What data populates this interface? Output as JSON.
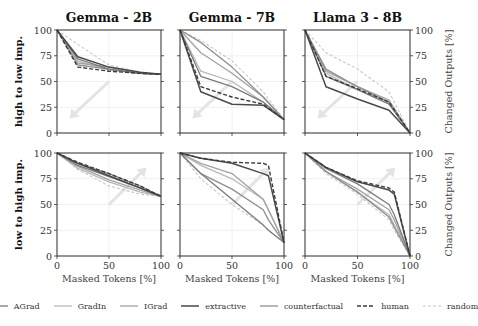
{
  "chart_data": {
    "type": "line",
    "layout": "2x3 grid of line plots",
    "columns": [
      "Gemma - 2B",
      "Gemma - 7B",
      "Llama 3 - 8B"
    ],
    "rows": [
      "high to low imp.",
      "low to high imp."
    ],
    "xlabel": "Masked Tokens [%]",
    "ylabel_right": "Changed Outputs [%]",
    "xlim": [
      0,
      100
    ],
    "ylim": [
      0,
      100
    ],
    "xticks": [
      0,
      50,
      100
    ],
    "yticks": [
      0,
      25,
      50,
      75,
      100
    ],
    "grid": true,
    "legend_position": "bottom",
    "legend": [
      "AGrad",
      "GradIn",
      "IGrad",
      "extractive",
      "counterfactual",
      "human",
      "random"
    ],
    "series_styles": {
      "AGrad": {
        "color": "#7a7a7a",
        "dash": "",
        "width": 1.3
      },
      "GradIn": {
        "color": "#b8b8b8",
        "dash": "",
        "width": 1.3
      },
      "IGrad": {
        "color": "#a2a2a2",
        "dash": "",
        "width": 1.3
      },
      "extractive": {
        "color": "#4a4a4a",
        "dash": "",
        "width": 1.5
      },
      "counterfactual": {
        "color": "#8e8e8e",
        "dash": "",
        "width": 1.3
      },
      "human": {
        "color": "#3c3c3c",
        "dash": "4,2",
        "width": 1.4
      },
      "random": {
        "color": "#c8c8c8",
        "dash": "3,2",
        "width": 1.1
      }
    },
    "annotations": [
      {
        "panel": "row1",
        "type": "arrow",
        "direction": "down-left",
        "color": "#e6e6e6"
      },
      {
        "panel": "row2",
        "type": "arrow",
        "direction": "up-right",
        "color": "#e6e6e6"
      }
    ],
    "panels": [
      {
        "row": "high to low imp.",
        "column": "Gemma - 2B",
        "x": [
          0,
          20,
          50,
          80,
          100
        ],
        "series": [
          {
            "name": "AGrad",
            "values": [
              100,
              72,
              62,
              58,
              57
            ]
          },
          {
            "name": "GradIn",
            "values": [
              100,
              70,
              61,
              58,
              57
            ]
          },
          {
            "name": "IGrad",
            "values": [
              100,
              68,
              64,
              58,
              57
            ]
          },
          {
            "name": "extractive",
            "values": [
              100,
              74,
              64,
              59,
              57
            ]
          },
          {
            "name": "counterfactual",
            "values": [
              100,
              66,
              62,
              58,
              57
            ]
          },
          {
            "name": "human",
            "values": [
              100,
              64,
              60,
              58,
              57
            ]
          },
          {
            "name": "random",
            "values": [
              100,
              86,
              66,
              59,
              57
            ]
          }
        ]
      },
      {
        "row": "high to low imp.",
        "column": "Gemma - 7B",
        "x": [
          0,
          20,
          50,
          80,
          100
        ],
        "series": [
          {
            "name": "AGrad",
            "values": [
              100,
              55,
              45,
              30,
              13
            ]
          },
          {
            "name": "GradIn",
            "values": [
              100,
              60,
              50,
              30,
              13
            ]
          },
          {
            "name": "IGrad",
            "values": [
              100,
              78,
              58,
              35,
              13
            ]
          },
          {
            "name": "extractive",
            "values": [
              100,
              40,
              28,
              27,
              13
            ]
          },
          {
            "name": "counterfactual",
            "values": [
              100,
              88,
              64,
              35,
              13
            ]
          },
          {
            "name": "human",
            "values": [
              100,
              45,
              35,
              28,
              13
            ]
          },
          {
            "name": "random",
            "values": [
              100,
              90,
              70,
              40,
              13
            ]
          }
        ]
      },
      {
        "row": "high to low imp.",
        "column": "Llama 3 - 8B",
        "x": [
          0,
          20,
          50,
          80,
          100
        ],
        "series": [
          {
            "name": "AGrad",
            "values": [
              100,
              55,
              42,
              28,
              0
            ]
          },
          {
            "name": "GradIn",
            "values": [
              100,
              58,
              42,
              30,
              0
            ]
          },
          {
            "name": "IGrad",
            "values": [
              100,
              60,
              45,
              32,
              0
            ]
          },
          {
            "name": "extractive",
            "values": [
              100,
              45,
              33,
              22,
              0
            ]
          },
          {
            "name": "counterfactual",
            "values": [
              100,
              62,
              45,
              30,
              0
            ]
          },
          {
            "name": "human",
            "values": [
              100,
              55,
              43,
              30,
              0
            ]
          },
          {
            "name": "random",
            "values": [
              100,
              78,
              62,
              40,
              0
            ]
          }
        ]
      },
      {
        "row": "low to high imp.",
        "column": "Gemma - 2B",
        "x": [
          0,
          20,
          50,
          80,
          100
        ],
        "series": [
          {
            "name": "AGrad",
            "values": [
              100,
              88,
              77,
              66,
              58
            ]
          },
          {
            "name": "GradIn",
            "values": [
              100,
              85,
              72,
              62,
              58
            ]
          },
          {
            "name": "IGrad",
            "values": [
              100,
              87,
              74,
              64,
              58
            ]
          },
          {
            "name": "extractive",
            "values": [
              100,
              90,
              78,
              66,
              58
            ]
          },
          {
            "name": "counterfactual",
            "values": [
              100,
              90,
              80,
              68,
              58
            ]
          },
          {
            "name": "human",
            "values": [
              100,
              91,
              80,
              68,
              58
            ]
          },
          {
            "name": "random",
            "values": [
              100,
              84,
              68,
              60,
              58
            ]
          }
        ]
      },
      {
        "row": "low to high imp.",
        "column": "Gemma - 7B",
        "x": [
          0,
          20,
          50,
          80,
          85,
          100
        ],
        "series": [
          {
            "name": "AGrad",
            "values": [
              100,
              80,
              55,
              30,
              25,
              13
            ]
          },
          {
            "name": "GradIn",
            "values": [
              100,
              88,
              75,
              55,
              45,
              13
            ]
          },
          {
            "name": "IGrad",
            "values": [
              100,
              90,
              80,
              55,
              45,
              13
            ]
          },
          {
            "name": "extractive",
            "values": [
              100,
              95,
              90,
              80,
              78,
              13
            ]
          },
          {
            "name": "counterfactual",
            "values": [
              100,
              80,
              65,
              45,
              35,
              13
            ]
          },
          {
            "name": "human",
            "values": [
              100,
              95,
              91,
              90,
              88,
              13
            ]
          },
          {
            "name": "random",
            "values": [
              100,
              75,
              50,
              30,
              25,
              13
            ]
          }
        ]
      },
      {
        "row": "low to high imp.",
        "column": "Llama 3 - 8B",
        "x": [
          0,
          20,
          50,
          80,
          85,
          100
        ],
        "series": [
          {
            "name": "AGrad",
            "values": [
              100,
              85,
              70,
              50,
              40,
              0
            ]
          },
          {
            "name": "GradIn",
            "values": [
              100,
              82,
              62,
              40,
              30,
              0
            ]
          },
          {
            "name": "IGrad",
            "values": [
              100,
              82,
              65,
              45,
              35,
              0
            ]
          },
          {
            "name": "extractive",
            "values": [
              100,
              86,
              72,
              64,
              60,
              0
            ]
          },
          {
            "name": "counterfactual",
            "values": [
              100,
              82,
              62,
              38,
              28,
              0
            ]
          },
          {
            "name": "human",
            "values": [
              100,
              86,
              73,
              66,
              62,
              0
            ]
          },
          {
            "name": "random",
            "values": [
              100,
              80,
              60,
              35,
              25,
              0
            ]
          }
        ]
      }
    ]
  }
}
